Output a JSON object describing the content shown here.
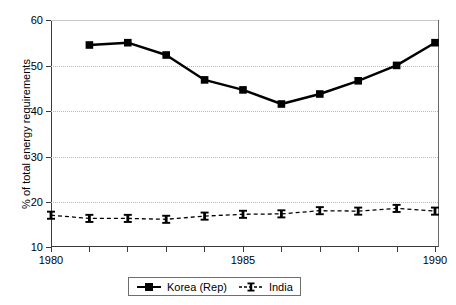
{
  "chart_data": {
    "type": "line",
    "title": "",
    "subtitle": "",
    "xlabel": "",
    "ylabel": "% of total energy requirements",
    "x": [
      1980,
      1981,
      1982,
      1983,
      1984,
      1985,
      1986,
      1987,
      1988,
      1989,
      1990
    ],
    "xlim": [
      1980,
      1991
    ],
    "ylim": [
      10,
      60
    ],
    "yticks": [
      10,
      20,
      30,
      40,
      50,
      60
    ],
    "ytick_labels": [
      "10",
      "20",
      "30",
      "40",
      "50",
      "60"
    ],
    "xticks": [
      1980,
      1981,
      1982,
      1983,
      1984,
      1985,
      1986,
      1987,
      1988,
      1989,
      1990
    ],
    "xtick_labels_shown": [
      "1980",
      "1985",
      "1990"
    ],
    "xtick_label_years": [
      1980,
      1985,
      1990
    ],
    "grid": "horizontal-dotted",
    "legend_position": "bottom-center",
    "series": [
      {
        "name": "Korea (Rep)",
        "marker": "filled-square",
        "line_style": "solid",
        "color": "#000000",
        "x": [
          1981,
          1982,
          1983,
          1984,
          1985,
          1986,
          1987,
          1988,
          1989,
          1990
        ],
        "values": [
          54.5,
          55.0,
          52.3,
          46.8,
          44.6,
          41.5,
          43.7,
          46.6,
          50.0,
          55.0
        ]
      },
      {
        "name": "India",
        "marker": "i-beam",
        "line_style": "dashed",
        "color": "#000000",
        "x": [
          1980,
          1981,
          1982,
          1983,
          1984,
          1985,
          1986,
          1987,
          1988,
          1989,
          1990
        ],
        "values": [
          17.0,
          16.3,
          16.3,
          16.1,
          16.8,
          17.2,
          17.3,
          18.0,
          17.9,
          18.5,
          17.9
        ]
      }
    ]
  },
  "axes": {
    "y_title": "% of total energy requirements",
    "y_labels": [
      "60",
      "50",
      "40",
      "30",
      "20",
      "10"
    ],
    "x_labels": [
      "1980",
      "1985",
      "1990"
    ]
  },
  "legend": {
    "entries": [
      {
        "label": "Korea (Rep)",
        "icon": "solid-line-square-marker"
      },
      {
        "label": "India",
        "icon": "dashed-line-ibeam-marker"
      }
    ]
  },
  "colors": {
    "series": "#000000",
    "grid": "#b9b9b9",
    "axis": "#3a3a3a",
    "background": "#ffffff"
  }
}
